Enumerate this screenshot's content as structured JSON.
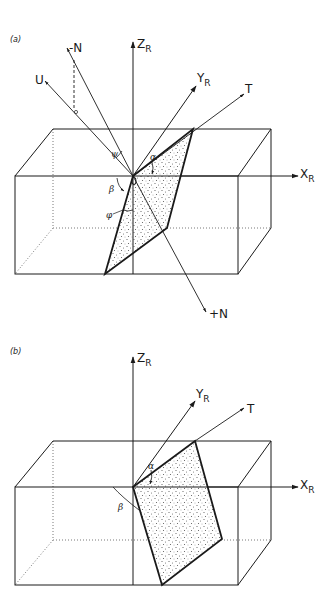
{
  "figure": {
    "panels": [
      {
        "id": "a",
        "label": "(a)",
        "axes": {
          "z": {
            "main": "Z",
            "sub": "R"
          },
          "y": {
            "main": "Y",
            "sub": "R"
          },
          "x": {
            "main": "X",
            "sub": "R"
          }
        },
        "vectors": {
          "minus_n": "-N",
          "plus_n": "+N",
          "u": "U",
          "t": "T"
        },
        "angles": {
          "beta": "β",
          "phi": "φ",
          "alpha": "α",
          "theta": "ψ"
        }
      },
      {
        "id": "b",
        "label": "(b)",
        "axes": {
          "z": {
            "main": "Z",
            "sub": "R"
          },
          "y": {
            "main": "Y",
            "sub": "R"
          },
          "x": {
            "main": "X",
            "sub": "R"
          }
        },
        "vectors": {
          "t": "T"
        },
        "angles": {
          "beta": "β",
          "alpha": "α"
        }
      }
    ],
    "colors": {
      "line": "#1a1a1a",
      "stipple": "#6a6a6a",
      "background": "#ffffff"
    }
  }
}
